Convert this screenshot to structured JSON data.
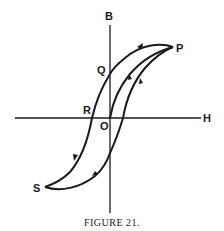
{
  "figure": {
    "caption": "FIGURE 21.",
    "type": "hysteresis loop (B–H curve)",
    "axes": {
      "vertical_label": "B",
      "horizontal_label": "H"
    },
    "points": {
      "P": "P",
      "Q": "Q",
      "R": "R",
      "O": "O",
      "S": "S"
    },
    "colors": {
      "ink": "#1a1a1a",
      "background": "#ffffff"
    }
  }
}
